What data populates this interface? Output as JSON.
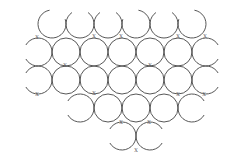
{
  "diagram": {
    "title": "",
    "stroke_color": "#444444",
    "label_color": "#555555",
    "background": "#ffffff",
    "radius": 14,
    "marker_label": "X",
    "circles": [
      {
        "cx": 52,
        "cy": 24,
        "arc": "open-top-right"
      },
      {
        "cx": 80,
        "cy": 24,
        "arc": "open-top"
      },
      {
        "cx": 108,
        "cy": 24,
        "arc": "open-top"
      },
      {
        "cx": 136,
        "cy": 24,
        "arc": "open-top-left"
      },
      {
        "cx": 164,
        "cy": 24,
        "arc": "open-top"
      },
      {
        "cx": 192,
        "cy": 24,
        "arc": "open-top-left"
      },
      {
        "cx": 38,
        "cy": 52,
        "arc": "open-left"
      },
      {
        "cx": 66,
        "cy": 52,
        "arc": "full"
      },
      {
        "cx": 94,
        "cy": 52,
        "arc": "full"
      },
      {
        "cx": 122,
        "cy": 52,
        "arc": "full"
      },
      {
        "cx": 150,
        "cy": 52,
        "arc": "full"
      },
      {
        "cx": 178,
        "cy": 52,
        "arc": "full"
      },
      {
        "cx": 206,
        "cy": 52,
        "arc": "open-right"
      },
      {
        "cx": 38,
        "cy": 80,
        "arc": "open-left"
      },
      {
        "cx": 66,
        "cy": 80,
        "arc": "full"
      },
      {
        "cx": 94,
        "cy": 80,
        "arc": "full"
      },
      {
        "cx": 122,
        "cy": 80,
        "arc": "full"
      },
      {
        "cx": 150,
        "cy": 80,
        "arc": "full"
      },
      {
        "cx": 178,
        "cy": 80,
        "arc": "full"
      },
      {
        "cx": 206,
        "cy": 80,
        "arc": "open-right"
      },
      {
        "cx": 80,
        "cy": 108,
        "arc": "open-left"
      },
      {
        "cx": 108,
        "cy": 108,
        "arc": "full"
      },
      {
        "cx": 136,
        "cy": 108,
        "arc": "full"
      },
      {
        "cx": 164,
        "cy": 108,
        "arc": "full"
      },
      {
        "cx": 192,
        "cy": 108,
        "arc": "open-right"
      },
      {
        "cx": 122,
        "cy": 136,
        "arc": "open-left"
      },
      {
        "cx": 150,
        "cy": 136,
        "arc": "open-right"
      }
    ],
    "markers": [
      {
        "x": 37,
        "y": 39
      },
      {
        "x": 94,
        "y": 38
      },
      {
        "x": 121,
        "y": 38
      },
      {
        "x": 178,
        "y": 38
      },
      {
        "x": 205,
        "y": 38
      },
      {
        "x": 65,
        "y": 67
      },
      {
        "x": 150,
        "y": 67
      },
      {
        "x": 37,
        "y": 96
      },
      {
        "x": 94,
        "y": 95
      },
      {
        "x": 178,
        "y": 96
      },
      {
        "x": 149,
        "y": 124
      },
      {
        "x": 204,
        "y": 96
      },
      {
        "x": 121,
        "y": 124
      },
      {
        "x": 136,
        "y": 152
      }
    ]
  }
}
